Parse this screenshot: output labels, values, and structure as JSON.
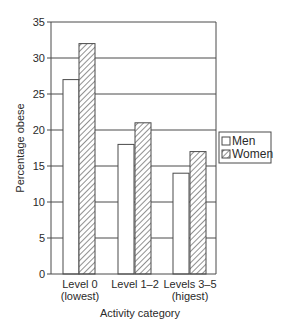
{
  "chart_data": {
    "type": "bar",
    "title": "",
    "xlabel": "Activity category",
    "ylabel": "Percentage obese",
    "categories": [
      {
        "line1": "Level 0",
        "line2": "(lowest)"
      },
      {
        "line1": "Level 1–2",
        "line2": ""
      },
      {
        "line1": "Levels 3–5",
        "line2": "(higest)"
      }
    ],
    "series": [
      {
        "name": "Men",
        "fill": "plain",
        "values": [
          27,
          18,
          14
        ]
      },
      {
        "name": "Women",
        "fill": "hatched",
        "values": [
          32,
          21,
          17
        ]
      }
    ],
    "ylim": [
      0,
      35
    ],
    "yticks": [
      0,
      5,
      10,
      15,
      20,
      25,
      30,
      35
    ],
    "grid": true,
    "legend_position": "right"
  },
  "colors": {
    "line": "#4a4a4a",
    "bar_fill": "#ffffff",
    "hatch": "#555555"
  }
}
